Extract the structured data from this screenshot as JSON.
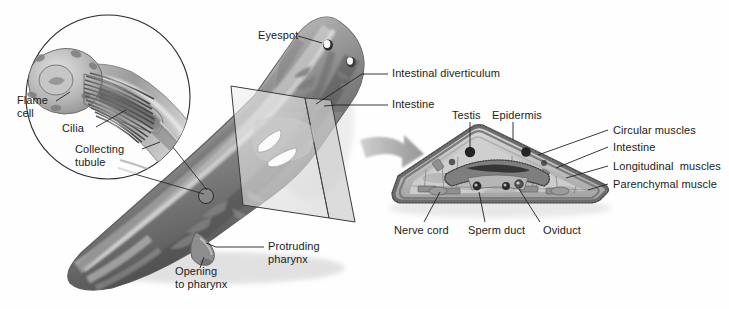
{
  "figure": {
    "background_color": "#fefefe",
    "ink_color": "#1b1b1b",
    "leader_line_color": "#232323",
    "body_gray_dark": "#5b5b5b",
    "body_gray_mid": "#8e8e8e",
    "body_gray_light": "#c4c4c4",
    "plane_gray": "#e3e3e3",
    "arrow_gray": "#9a9a9a"
  },
  "inset": {
    "name": "flame-cell-inset",
    "labels": {
      "flame_cell": "Flame\ncell",
      "cilia": "Cilia",
      "collecting_tubule": "Collecting\ntubule"
    }
  },
  "whole_animal": {
    "name": "planarian-body",
    "labels": {
      "eyespot": "Eyespot",
      "intestinal_diverticulum": "Intestinal diverticulum",
      "intestine": "Intestine",
      "protruding_pharynx": "Protruding\npharynx",
      "opening_to_pharynx": "Opening\nto pharynx"
    }
  },
  "cross_section": {
    "name": "cross-section",
    "labels_top": {
      "testis": "Testis",
      "epidermis": "Epidermis"
    },
    "labels_right": {
      "circular_muscles": "Circular muscles",
      "intestine": "Intestine",
      "longitudinal_muscles": "Longitudinal  muscles",
      "parenchymal_muscle": "Parenchymal muscle"
    },
    "labels_bottom": {
      "nerve_cord": "Nerve cord",
      "sperm_duct": "Sperm duct",
      "oviduct": "Oviduct"
    }
  }
}
